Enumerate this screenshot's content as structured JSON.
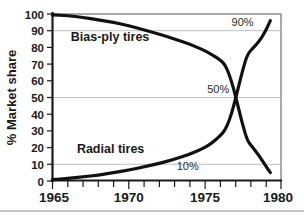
{
  "chart_data": {
    "type": "line",
    "title": "",
    "xlabel": "",
    "ylabel": "% Market share",
    "xlim": [
      1965,
      1980
    ],
    "ylim": [
      0,
      100
    ],
    "grid": "horizontal gridlines at 10, 50 and 90 only",
    "legend": "inline series labels inside plot area",
    "x_ticks_major": [
      "1965",
      "1970",
      "1975",
      "1980"
    ],
    "x_ticks_minor_interval": 1,
    "y_ticks": [
      "0",
      "10",
      "20",
      "30",
      "40",
      "50",
      "60",
      "70",
      "80",
      "90",
      "100"
    ],
    "gridline_values": [
      10,
      50,
      90
    ],
    "series": [
      {
        "name": "Bias-ply tires",
        "label_x": 1966.2,
        "label_y": 84,
        "x": [
          1965,
          1966,
          1967,
          1968,
          1969,
          1970,
          1971,
          1972,
          1973,
          1974,
          1975,
          1975.5,
          1976,
          1976.3,
          1976.6,
          1976.9,
          1977.2,
          1977.5,
          1977.8,
          1978.1,
          1978.5,
          1979,
          1979.3
        ],
        "values": [
          99.5,
          99,
          98,
          96.5,
          95,
          93,
          90.5,
          88,
          85,
          82,
          78,
          75.5,
          72.5,
          70,
          64,
          55,
          44,
          33,
          24,
          20.5,
          16,
          9,
          5
        ]
      },
      {
        "name": "Radial tires",
        "label_x": 1966.6,
        "label_y": 17,
        "x": [
          1965,
          1966,
          1967,
          1968,
          1969,
          1970,
          1971,
          1972,
          1973,
          1974,
          1975,
          1975.5,
          1976,
          1976.3,
          1976.6,
          1976.9,
          1977.2,
          1977.5,
          1977.8,
          1978.2,
          1978.6,
          1979,
          1979.3
        ],
        "values": [
          0.8,
          1.5,
          2.5,
          3.5,
          5,
          6.5,
          8.5,
          10.5,
          13,
          16,
          20,
          23,
          27,
          30,
          36,
          45,
          56,
          67,
          76,
          80,
          84,
          90,
          96
        ]
      }
    ],
    "annotations": [
      {
        "text": "90%",
        "x": 1978.2,
        "y": 93
      },
      {
        "text": "50%",
        "x": 1976.6,
        "y": 53
      },
      {
        "text": "10%",
        "x": 1974.6,
        "y": 6.5
      }
    ]
  }
}
